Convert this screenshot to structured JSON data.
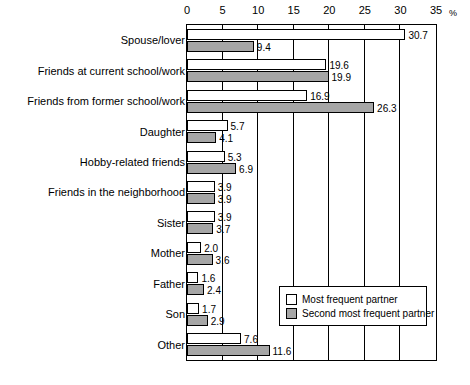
{
  "chart_data": {
    "type": "bar",
    "orientation": "horizontal",
    "title": "",
    "subtitle": "",
    "xlabel": "%",
    "ylabel": "",
    "xlim": [
      0,
      35
    ],
    "xticks": [
      0,
      5,
      10,
      15,
      20,
      25,
      30,
      35
    ],
    "xtick_labels": [
      "0",
      "5",
      "10",
      "15",
      "20",
      "25",
      "30",
      "35"
    ],
    "x_unit": "%",
    "grid": true,
    "legend_position": "inside-bottom-right",
    "categories": [
      "Spouse/lover",
      "Friends at current school/work",
      "Friends from former school/work",
      "Daughter",
      "Hobby-related friends",
      "Friends in the neighborhood",
      "Sister",
      "Mother",
      "Father",
      "Son",
      "Other"
    ],
    "series": [
      {
        "name": "Most frequent partner",
        "color": "#ffffff",
        "values": [
          30.7,
          19.6,
          16.9,
          5.7,
          5.3,
          3.9,
          3.9,
          2.0,
          1.6,
          1.7,
          7.6
        ],
        "labels": [
          "30.7",
          "19.6",
          "16.9",
          "5.7",
          "5.3",
          "3.9",
          "3.9",
          "2.0",
          "1.6",
          "1.7",
          "7.6"
        ]
      },
      {
        "name": "Second most frequent partner",
        "color": "#a6a6a6",
        "values": [
          9.4,
          19.9,
          26.3,
          4.1,
          6.9,
          3.9,
          3.7,
          3.6,
          2.4,
          2.9,
          11.6
        ],
        "labels": [
          "9.4",
          "19.9",
          "26.3",
          "4.1",
          "6.9",
          "3.9",
          "3.7",
          "3.6",
          "2.4",
          "2.9",
          "11.6"
        ]
      }
    ]
  },
  "legend": {
    "items": [
      {
        "label": "Most frequent partner"
      },
      {
        "label": "Second most frequent partner"
      }
    ]
  }
}
